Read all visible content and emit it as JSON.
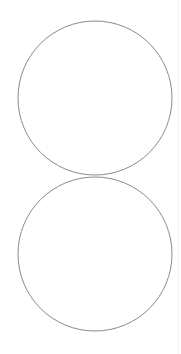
{
  "diagram": {
    "type": "two-stacked-circles",
    "shapes": [
      {
        "kind": "circle",
        "label": "upper-circle",
        "fill": "#ffffff",
        "stroke": "#8a8a8a"
      },
      {
        "kind": "circle",
        "label": "lower-circle",
        "fill": "#ffffff",
        "stroke": "#8a8a8a"
      }
    ],
    "relationship": "tangent",
    "background": "#ffffff"
  }
}
